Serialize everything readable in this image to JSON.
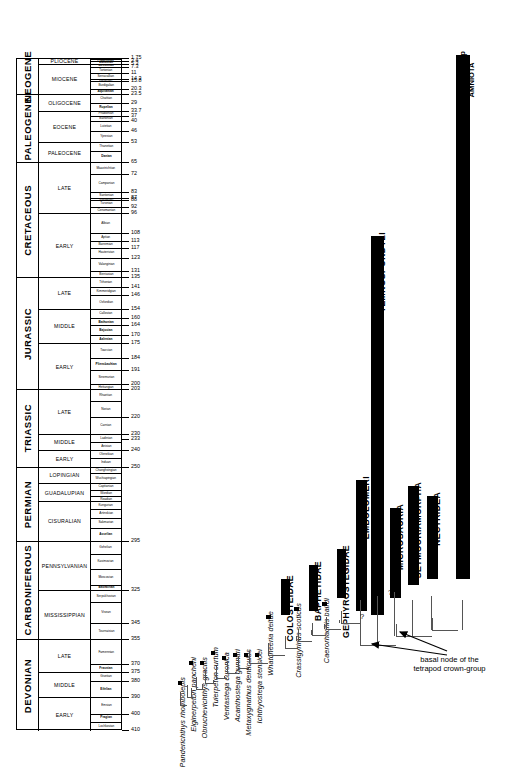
{
  "figure": {
    "type": "stratigraphic-range-chart-with-cladogram",
    "annotation": "basal node of the\ntetrapod crown-group",
    "annotation_line1": "basal node of the",
    "annotation_line2": "tetrapod crown-group",
    "uncertainty_marks": [
      "?",
      "?"
    ],
    "colors": {
      "bar": "#000000",
      "line": "#555555",
      "background": "#ffffff"
    }
  },
  "timescale": {
    "age_unit": "Ma",
    "range_top": 0,
    "range_bottom": 410,
    "periods": [
      {
        "name": "NEOGENE",
        "top": 1.75,
        "bottom": 23.5
      },
      {
        "name": "PALEOGENE",
        "top": 23.5,
        "bottom": 65
      },
      {
        "name": "CRETACEOUS",
        "top": 65,
        "bottom": 135
      },
      {
        "name": "JURASSIC",
        "top": 135,
        "bottom": 203
      },
      {
        "name": "TRIASSIC",
        "top": 203,
        "bottom": 250
      },
      {
        "name": "PERMIAN",
        "top": 250,
        "bottom": 295
      },
      {
        "name": "CARBONIFEROUS",
        "top": 295,
        "bottom": 355
      },
      {
        "name": "DEVONIAN",
        "top": 355,
        "bottom": 410
      }
    ],
    "epochs": [
      {
        "name": "PLIOCENE",
        "top": 1.75,
        "bottom": 5.3
      },
      {
        "name": "MIOCENE",
        "top": 5.3,
        "bottom": 23.5
      },
      {
        "name": "OLIGOCENE",
        "top": 23.5,
        "bottom": 33.7
      },
      {
        "name": "EOCENE",
        "top": 33.7,
        "bottom": 53
      },
      {
        "name": "PALEOCENE",
        "top": 53,
        "bottom": 65
      },
      {
        "name": "LATE",
        "top": 65,
        "bottom": 96
      },
      {
        "name": "EARLY",
        "top": 96,
        "bottom": 135
      },
      {
        "name": "LATE",
        "top": 135,
        "bottom": 154
      },
      {
        "name": "MIDDLE",
        "top": 154,
        "bottom": 175
      },
      {
        "name": "EARLY",
        "top": 175,
        "bottom": 203
      },
      {
        "name": "LATE",
        "top": 203,
        "bottom": 230
      },
      {
        "name": "MIDDLE",
        "top": 230,
        "bottom": 240
      },
      {
        "name": "EARLY",
        "top": 240,
        "bottom": 250
      },
      {
        "name": "LOPINGIAN",
        "top": 250,
        "bottom": 260
      },
      {
        "name": "GUADALUPIAN",
        "top": 260,
        "bottom": 271
      },
      {
        "name": "CISURALIAN",
        "top": 271,
        "bottom": 295
      },
      {
        "name": "PENNSYLVANIAN",
        "top": 295,
        "bottom": 325
      },
      {
        "name": "MISSISSIPPIAN",
        "top": 325,
        "bottom": 355
      },
      {
        "name": "LATE",
        "top": 355,
        "bottom": 375
      },
      {
        "name": "MIDDLE",
        "top": 375,
        "bottom": 390
      },
      {
        "name": "EARLY",
        "top": 390,
        "bottom": 410
      }
    ],
    "stages": [
      {
        "name": "Gelasian",
        "top": 1.75,
        "bottom": 2.6,
        "bold": true
      },
      {
        "name": "Piacenzian",
        "top": 2.6,
        "bottom": 3.4,
        "bold": true
      },
      {
        "name": "Zanclean",
        "top": 3.4,
        "bottom": 5.3,
        "bold": true
      },
      {
        "name": "Messinian",
        "top": 5.3,
        "bottom": 7.3,
        "bold": true
      },
      {
        "name": "Tortonian",
        "top": 7.3,
        "bottom": 11,
        "bold": false
      },
      {
        "name": "Serravallian",
        "top": 11,
        "bottom": 14.3,
        "bold": false
      },
      {
        "name": "Langhian",
        "top": 14.3,
        "bottom": 15.8,
        "bold": false
      },
      {
        "name": "Burdigalian",
        "top": 15.8,
        "bottom": 20.3,
        "bold": false
      },
      {
        "name": "Aquitanian",
        "top": 20.3,
        "bottom": 23.5,
        "bold": true
      },
      {
        "name": "Chattian",
        "top": 23.5,
        "bottom": 29,
        "bold": false
      },
      {
        "name": "Rupelian",
        "top": 29,
        "bottom": 33.7,
        "bold": true
      },
      {
        "name": "Priabonian",
        "top": 33.7,
        "bottom": 37,
        "bold": false
      },
      {
        "name": "Bartonian",
        "top": 37,
        "bottom": 40,
        "bold": false
      },
      {
        "name": "Lutetian",
        "top": 40,
        "bottom": 46,
        "bold": false
      },
      {
        "name": "Ypresian",
        "top": 46,
        "bottom": 53,
        "bold": false
      },
      {
        "name": "Thanetian",
        "top": 53,
        "bottom": 58,
        "bold": false
      },
      {
        "name": "Danian",
        "top": 58,
        "bottom": 65,
        "bold": true
      },
      {
        "name": "Maastrichtian",
        "top": 65,
        "bottom": 72,
        "bold": false
      },
      {
        "name": "Campanian",
        "top": 72,
        "bottom": 83,
        "bold": false
      },
      {
        "name": "Santonian",
        "top": 83,
        "bottom": 87,
        "bold": false
      },
      {
        "name": "Coniacian",
        "top": 87,
        "bottom": 88,
        "bold": false
      },
      {
        "name": "Turonian",
        "top": 88,
        "bottom": 92,
        "bold": false
      },
      {
        "name": "Cenomanian",
        "top": 92,
        "bottom": 96,
        "bold": false
      },
      {
        "name": "Albian",
        "top": 96,
        "bottom": 108,
        "bold": false
      },
      {
        "name": "Aptian",
        "top": 108,
        "bottom": 113,
        "bold": false
      },
      {
        "name": "Barremian",
        "top": 113,
        "bottom": 117,
        "bold": false
      },
      {
        "name": "Hauterivian",
        "top": 117,
        "bottom": 123,
        "bold": false
      },
      {
        "name": "Valanginian",
        "top": 123,
        "bottom": 131,
        "bold": false
      },
      {
        "name": "Berriasian",
        "top": 131,
        "bottom": 135,
        "bold": false
      },
      {
        "name": "Tithonian",
        "top": 135,
        "bottom": 141,
        "bold": false
      },
      {
        "name": "Kimmeridgian",
        "top": 141,
        "bottom": 146,
        "bold": false
      },
      {
        "name": "Oxfordian",
        "top": 146,
        "bottom": 154,
        "bold": false
      },
      {
        "name": "Callovian",
        "top": 154,
        "bottom": 160,
        "bold": false
      },
      {
        "name": "Bathonian",
        "top": 160,
        "bottom": 164,
        "bold": true
      },
      {
        "name": "Bajocian",
        "top": 164,
        "bottom": 170,
        "bold": true
      },
      {
        "name": "Aalenian",
        "top": 170,
        "bottom": 175,
        "bold": true
      },
      {
        "name": "Toarcian",
        "top": 175,
        "bottom": 184,
        "bold": false
      },
      {
        "name": "Pliensbachian",
        "top": 184,
        "bottom": 191,
        "bold": true
      },
      {
        "name": "Sinemurian",
        "top": 191,
        "bottom": 200,
        "bold": false
      },
      {
        "name": "Hettangian",
        "top": 200,
        "bottom": 203,
        "bold": false
      },
      {
        "name": "Rhaetian",
        "top": 203,
        "bottom": 210,
        "bold": false
      },
      {
        "name": "Norian",
        "top": 210,
        "bottom": 220,
        "bold": false
      },
      {
        "name": "Carnian",
        "top": 220,
        "bottom": 230,
        "bold": false
      },
      {
        "name": "Ladinian",
        "top": 230,
        "bottom": 235,
        "bold": false
      },
      {
        "name": "Anisian",
        "top": 235,
        "bottom": 240,
        "bold": false
      },
      {
        "name": "Olenekian",
        "top": 240,
        "bottom": 245,
        "bold": false
      },
      {
        "name": "Induan",
        "top": 245,
        "bottom": 250,
        "bold": false
      },
      {
        "name": "Changhsingian",
        "top": 250,
        "bottom": 254,
        "bold": false
      },
      {
        "name": "Wuchiapingian",
        "top": 254,
        "bottom": 260,
        "bold": false
      },
      {
        "name": "Capitanian",
        "top": 260,
        "bottom": 264,
        "bold": false
      },
      {
        "name": "Wordian",
        "top": 264,
        "bottom": 268,
        "bold": false
      },
      {
        "name": "Roadian",
        "top": 268,
        "bottom": 271,
        "bold": false
      },
      {
        "name": "Kungurian",
        "top": 271,
        "bottom": 276,
        "bold": false
      },
      {
        "name": "Artinskian",
        "top": 276,
        "bottom": 281,
        "bold": false
      },
      {
        "name": "Sakmarian",
        "top": 281,
        "bottom": 287,
        "bold": false
      },
      {
        "name": "Asselian",
        "top": 287,
        "bottom": 295,
        "bold": true
      },
      {
        "name": "Gzhelian",
        "top": 295,
        "bottom": 303,
        "bold": false
      },
      {
        "name": "Kasimovian",
        "top": 303,
        "bottom": 312,
        "bold": false
      },
      {
        "name": "Moscovian",
        "top": 312,
        "bottom": 322,
        "bold": false
      },
      {
        "name": "Bashkirian",
        "top": 322,
        "bottom": 325,
        "bold": true
      },
      {
        "name": "Serpukhovian",
        "top": 325,
        "bottom": 332,
        "bold": false
      },
      {
        "name": "Visean",
        "top": 332,
        "bottom": 345,
        "bold": false
      },
      {
        "name": "Tournaisian",
        "top": 345,
        "bottom": 355,
        "bold": false
      },
      {
        "name": "Famennian",
        "top": 355,
        "bottom": 370,
        "bold": false
      },
      {
        "name": "Frasnian",
        "top": 370,
        "bottom": 375,
        "bold": true
      },
      {
        "name": "Givetian",
        "top": 375,
        "bottom": 380,
        "bold": false
      },
      {
        "name": "Eifelian",
        "top": 380,
        "bottom": 390,
        "bold": true
      },
      {
        "name": "Emsian",
        "top": 390,
        "bottom": 400,
        "bold": false
      },
      {
        "name": "Pragian",
        "top": 400,
        "bottom": 405,
        "bold": true
      },
      {
        "name": "Lochkovian",
        "top": 405,
        "bottom": 410,
        "bold": false
      }
    ],
    "age_labels": [
      1.75,
      3.4,
      5.3,
      7.3,
      11,
      14.3,
      15.8,
      20.3,
      23.5,
      29,
      33.7,
      37,
      40,
      46,
      53,
      65,
      72,
      83,
      87,
      88,
      92,
      96,
      108,
      113,
      117,
      123,
      131,
      135,
      141,
      146,
      154,
      160,
      164,
      170,
      175,
      184,
      191,
      200,
      203,
      220,
      230,
      233,
      240,
      250,
      295,
      325,
      345,
      355,
      370,
      375,
      380,
      390,
      400,
      410
    ]
  },
  "chart_data": {
    "type": "range-chart",
    "xlabel": "",
    "ylabel": "Geological time (Ma)",
    "ylim": [
      410,
      0
    ],
    "grid": false,
    "legend": "none",
    "taxa": [
      {
        "label": "Panderichthys rhombolepis",
        "kind": "species",
        "first": 380,
        "last": 380
      },
      {
        "label": "Elginerpeton pancheni",
        "kind": "species",
        "first": 368,
        "last": 368
      },
      {
        "label": "Obruchevichthys gracilis",
        "kind": "species",
        "first": 368,
        "last": 368
      },
      {
        "label": "Tulerpeton curtum",
        "kind": "species",
        "first": 362,
        "last": 362
      },
      {
        "label": "Ventastega curonica",
        "kind": "species",
        "first": 365,
        "last": 365
      },
      {
        "label": "Acanthostega gunnari",
        "kind": "species",
        "first": 363,
        "last": 363
      },
      {
        "label": "Metaxygnathus denticulus",
        "kind": "species",
        "first": 363,
        "last": 363
      },
      {
        "label": "Ichthyostega stensioei",
        "kind": "species",
        "first": 363,
        "last": 363
      },
      {
        "label": "Whatcheeria deltae",
        "kind": "species",
        "first": 340,
        "last": 340
      },
      {
        "label": "COLOSTEIDAE",
        "kind": "clade",
        "first": 340,
        "last": 318
      },
      {
        "label": "Crassigyrinus scoticus",
        "kind": "species",
        "first": 335,
        "last": 335
      },
      {
        "label": "BAPHETIDAE",
        "kind": "clade",
        "first": 338,
        "last": 310
      },
      {
        "label": "Caerorhachis bairdi",
        "kind": "species",
        "first": 332,
        "last": 332
      },
      {
        "label": "GEPHYROSTEGIDAE",
        "kind": "clade",
        "first": 330,
        "last": 300
      },
      {
        "label": "EMBOLOMERI",
        "kind": "clade",
        "first": 338,
        "last": 258
      },
      {
        "label": "MICROSAURIA",
        "kind": "clade",
        "first": 330,
        "last": 275
      },
      {
        "label": "SEYMOURIAMORPHA",
        "kind": "clade",
        "first": 322,
        "last": 262
      },
      {
        "label": "NECTRIDEA",
        "kind": "clade",
        "first": 318,
        "last": 268
      },
      {
        "label": "TEMNOSPONDYLI",
        "kind": "clade",
        "first": 340,
        "last": 110
      },
      {
        "label": "crown-group\nAMNIOTA",
        "kind": "clade",
        "first": 318,
        "last": 0
      }
    ],
    "crown_group_label_line1": "crown-group",
    "crown_group_label_line2": "AMNIOTA"
  }
}
